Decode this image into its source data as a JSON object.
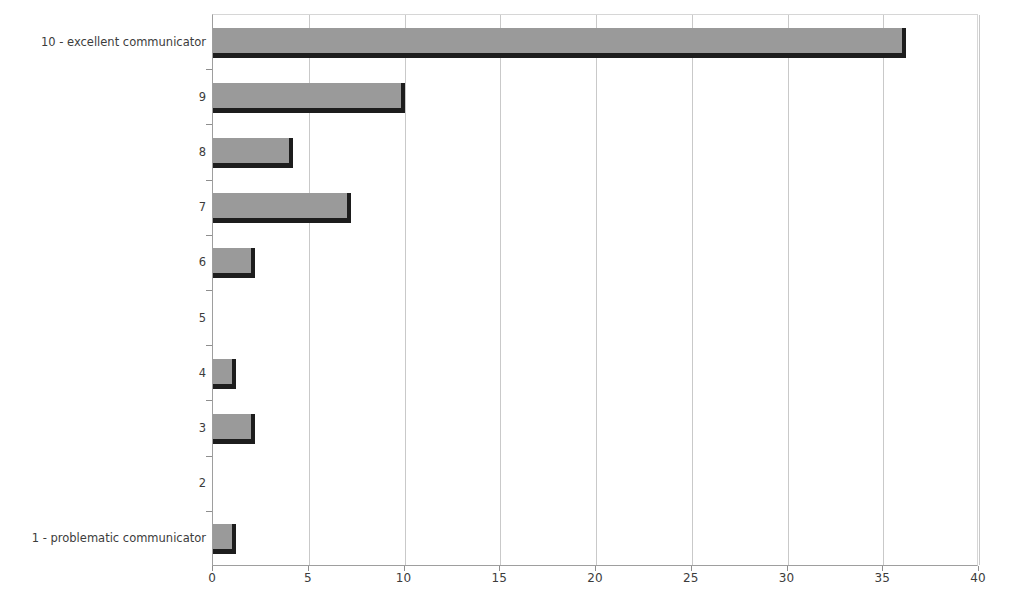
{
  "chart_data": {
    "type": "bar",
    "orientation": "horizontal",
    "title": "",
    "xlabel": "",
    "ylabel": "",
    "categories": [
      "10 - excellent communicator",
      "9",
      "8",
      "7",
      "6",
      "5",
      "4",
      "3",
      "2",
      "1 - problematic communicator"
    ],
    "values": [
      36.2,
      10,
      4.2,
      7.2,
      2.2,
      0,
      1.2,
      2.2,
      0,
      1.2
    ],
    "xlim": [
      0,
      40
    ],
    "xticks": [
      0,
      5,
      10,
      15,
      20,
      25,
      30,
      35,
      40
    ],
    "xtick_labels": [
      "0",
      "5",
      "10",
      "15",
      "20",
      "25",
      "30",
      "35",
      "40"
    ],
    "grid": "vertical",
    "legend": "none",
    "bar_color": "#9a9a9a",
    "bar_shadow_color": "#1d1d1d",
    "gridline_color": "#c9c9c9",
    "axis_color": "#9e9e9e"
  }
}
